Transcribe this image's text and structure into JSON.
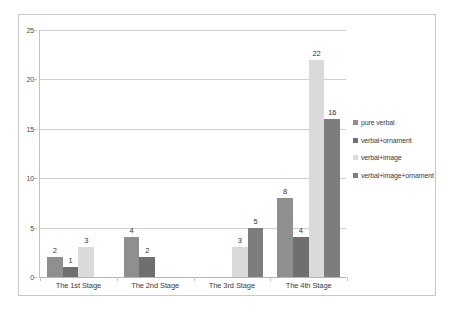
{
  "chart_data": {
    "type": "bar",
    "title": "",
    "subtitle": "",
    "xlabel": "",
    "ylabel": "",
    "ylim": [
      0,
      25
    ],
    "yticks": [
      0,
      5,
      10,
      15,
      20,
      25
    ],
    "ytick_labels": [
      "0",
      "5",
      "10",
      "15",
      "20",
      "25"
    ],
    "grid": "horizontal",
    "legend_position": "right",
    "categories": [
      "The 1st Stage",
      "The 2nd Stage",
      "The 3rd Stage",
      "The 4th Stage"
    ],
    "series": [
      {
        "name": "pure verbal",
        "color": "#8f8f8f",
        "values": [
          2,
          4,
          null,
          8
        ],
        "labels": [
          "2",
          "4",
          "",
          "8"
        ]
      },
      {
        "name": "verbal+ornament",
        "color": "#6f6f6f",
        "values": [
          1,
          2,
          null,
          4
        ],
        "labels": [
          "1",
          "2",
          "",
          "4"
        ]
      },
      {
        "name": "verbal+image",
        "color": "#dadada",
        "values": [
          3,
          null,
          3,
          22
        ],
        "labels": [
          "3",
          "",
          "3",
          "22"
        ]
      },
      {
        "name": "verbal+image+ornament",
        "color": "#7d7d7d",
        "values": [
          null,
          null,
          5,
          16
        ],
        "labels": [
          "",
          "",
          "5",
          "16"
        ]
      }
    ]
  },
  "legend": {
    "items": [
      {
        "label": "pure verbal",
        "color": "#8f8f8f"
      },
      {
        "label": "verbal+ornament",
        "color": "#6f6f6f"
      },
      {
        "label": "verbal+image",
        "color": "#dadada"
      },
      {
        "label": "verbal+image+ornament",
        "color": "#7d7d7d"
      }
    ]
  },
  "colors": {
    "frame_border": "#c9c9c9",
    "gridline": "#d0d0d0",
    "axis_line": "#c2c2c2",
    "text": "#3b3b3b",
    "background": "#ffffff"
  }
}
